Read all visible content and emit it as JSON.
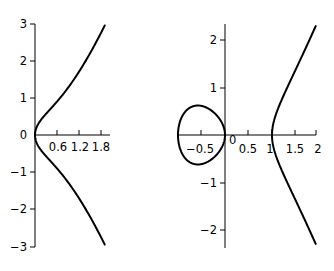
{
  "chart_data": [
    {
      "type": "line",
      "title": "",
      "equation": "y^2 = x^3 + x",
      "xlabel": "",
      "ylabel": "",
      "xlim": [
        0,
        2.05
      ],
      "ylim": [
        -3,
        3
      ],
      "grid": false,
      "legend": null,
      "x_ticks": [
        0.6,
        1.2,
        1.8
      ],
      "x_tick_labels": [
        "0.6",
        "1.2",
        "1.8"
      ],
      "y_ticks": [
        -3,
        -2,
        -1,
        0,
        1,
        2,
        3
      ],
      "y_tick_labels": [
        "−3",
        "−2",
        "−1",
        "0",
        "1",
        "2",
        "3"
      ],
      "series": [
        {
          "name": "upper branch",
          "x": [
            0,
            0.1,
            0.3,
            0.6,
            0.9,
            1.2,
            1.5,
            1.8,
            1.9
          ],
          "y": [
            0,
            0.33,
            0.58,
            0.91,
            1.26,
            1.65,
            2.09,
            2.6,
            2.96
          ]
        },
        {
          "name": "lower branch",
          "x": [
            0,
            0.1,
            0.3,
            0.6,
            0.9,
            1.2,
            1.5,
            1.8,
            1.9
          ],
          "y": [
            0,
            -0.33,
            -0.58,
            -0.91,
            -1.26,
            -1.65,
            -2.09,
            -2.6,
            -2.96
          ]
        }
      ]
    },
    {
      "type": "line",
      "title": "",
      "equation": "y^2 = x^3 - x",
      "xlabel": "",
      "ylabel": "",
      "xlim": [
        -1,
        2
      ],
      "ylim": [
        -2.35,
        2.35
      ],
      "grid": false,
      "legend": null,
      "x_ticks": [
        -0.5,
        0,
        0.5,
        1,
        1.5,
        2
      ],
      "x_tick_labels": [
        "−0.5",
        "0",
        "0.5",
        "1",
        "1.5",
        "2"
      ],
      "y_ticks": [
        -2,
        -1,
        1,
        2
      ],
      "y_tick_labels": [
        "−2",
        "−1",
        "1",
        "2"
      ],
      "series": [
        {
          "name": "oval",
          "x": [
            -1,
            -0.8,
            -0.577,
            -0.3,
            0
          ],
          "y_upper": [
            0,
            0.54,
            0.62,
            0.52,
            0
          ],
          "y_lower": [
            0,
            -0.54,
            -0.62,
            -0.52,
            0
          ]
        },
        {
          "name": "unbounded branch",
          "x": [
            1,
            1.1,
            1.3,
            1.5,
            1.7,
            1.93
          ],
          "y_upper": [
            0,
            0.48,
            0.96,
            1.37,
            1.78,
            2.29
          ],
          "y_lower": [
            0,
            -0.48,
            -0.96,
            -1.37,
            -1.78,
            -2.29
          ]
        }
      ]
    }
  ],
  "left_plot": {
    "zero_label": "0",
    "x_labels": [
      "0.6",
      "1.2",
      "1.8"
    ],
    "y_labels": [
      "3",
      "2",
      "1",
      "−1",
      "−2",
      "−3"
    ]
  },
  "right_plot": {
    "zero_label": "0",
    "x_labels": [
      "−0.5",
      "0.5",
      "1",
      "1.5",
      "2"
    ],
    "y_labels": [
      "2",
      "1",
      "−1",
      "−2"
    ]
  }
}
